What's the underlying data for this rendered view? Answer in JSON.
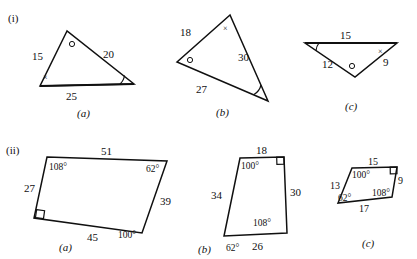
{
  "figure": {
    "rows": [
      {
        "row_label": "(i)",
        "shapes": [
          {
            "sublabel": "(a)",
            "type": "triangle",
            "side_labels": [
              "15",
              "20",
              "25"
            ],
            "angle_marks": [
              "cross",
              "circle",
              "arc"
            ]
          },
          {
            "sublabel": "(b)",
            "type": "triangle",
            "side_labels": [
              "18",
              "30",
              "27"
            ],
            "angle_marks": [
              "cross",
              "circle",
              "arc"
            ]
          },
          {
            "sublabel": "(c)",
            "type": "triangle",
            "side_labels": [
              "15",
              "9",
              "12"
            ],
            "angle_marks": [
              "cross",
              "circle",
              "arc"
            ]
          }
        ]
      },
      {
        "row_label": "(ii)",
        "shapes": [
          {
            "sublabel": "(a)",
            "type": "quadrilateral",
            "side_labels": [
              "51",
              "39",
              "45",
              "27"
            ],
            "angle_labels": [
              "108°",
              "62°",
              "100°"
            ],
            "right_angle": true
          },
          {
            "sublabel": "(b)",
            "type": "quadrilateral",
            "side_labels": [
              "18",
              "30",
              "26",
              "34"
            ],
            "angle_labels": [
              "100°",
              "108°",
              "62°"
            ],
            "right_angle": true
          },
          {
            "sublabel": "(c)",
            "type": "quadrilateral",
            "side_labels": [
              "15",
              "9",
              "17",
              "13"
            ],
            "angle_labels": [
              "100°",
              "108°",
              "62°"
            ],
            "right_angle": true
          }
        ]
      }
    ],
    "text": {
      "row1_label": "(i)",
      "row2_label": "(ii)",
      "ia_sub": "(a)",
      "ib_sub": "(b)",
      "ic_sub": "(c)",
      "iia_sub": "(a)",
      "iib_sub": "(b)",
      "iic_sub": "(c)",
      "ia_s15": "15",
      "ia_s20": "20",
      "ia_s25": "25",
      "ia_cross": "×",
      "ib_s18": "18",
      "ib_s30": "30",
      "ib_s27": "27",
      "ib_cross": "×",
      "ic_s15": "15",
      "ic_s9": "9",
      "ic_s12": "12",
      "ic_cross": "×",
      "iia_s51": "51",
      "iia_s39": "39",
      "iia_s45": "45",
      "iia_s27": "27",
      "iia_a108": "108°",
      "iia_a62": "62°",
      "iia_a100": "100°",
      "iib_s18": "18",
      "iib_s30": "30",
      "iib_s26": "26",
      "iib_s34": "34",
      "iib_a100": "100°",
      "iib_a108": "108°",
      "iib_a62": "62°",
      "iic_s15": "15",
      "iic_s9": "9",
      "iic_s17": "17",
      "iic_s13": "13",
      "iic_a100": "100°",
      "iic_a108": "108°",
      "iic_a62": "62°"
    },
    "colors": {
      "ink": "#101010",
      "paper": "#ffffff"
    }
  }
}
